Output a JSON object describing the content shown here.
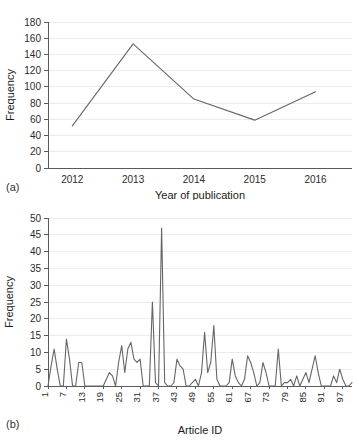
{
  "figure": {
    "panel_a_label": "(a)",
    "panel_b_label": "(b)"
  },
  "chart_data": [
    {
      "id": "panel-a",
      "type": "line",
      "title": "",
      "xlabel": "Year of publication",
      "ylabel": "Frequency",
      "categories": [
        "2012",
        "2013",
        "2014",
        "2015",
        "2016"
      ],
      "x": [
        2012,
        2013,
        2014,
        2015,
        2016
      ],
      "values": [
        52,
        153,
        85,
        59,
        94
      ],
      "xlim": [
        2011.6,
        2016.6
      ],
      "ylim": [
        0,
        180
      ],
      "yticks": [
        0,
        20,
        40,
        60,
        80,
        100,
        120,
        140,
        160,
        180
      ],
      "ytick_labels": [
        "0",
        "20",
        "40",
        "60",
        "80",
        "100",
        "120",
        "140",
        "160",
        "180"
      ],
      "xtick_labels": [
        "2012",
        "2013",
        "2014",
        "2015",
        "2016"
      ],
      "grid": "horizontal",
      "legend": "none",
      "line_color": "#666666"
    },
    {
      "id": "panel-b",
      "type": "line",
      "title": "",
      "xlabel": "Article ID",
      "ylabel": "Frequency",
      "xlim": [
        1,
        100
      ],
      "ylim": [
        0,
        50
      ],
      "yticks": [
        0,
        5,
        10,
        15,
        20,
        25,
        30,
        35,
        40,
        45,
        50
      ],
      "ytick_labels": [
        "0",
        "5",
        "10",
        "15",
        "20",
        "25",
        "30",
        "35",
        "40",
        "45",
        "50"
      ],
      "xticks": [
        1,
        7,
        13,
        19,
        25,
        31,
        37,
        43,
        49,
        55,
        61,
        67,
        73,
        79,
        85,
        91,
        97
      ],
      "xtick_labels": [
        "1",
        "7",
        "13",
        "19",
        "25",
        "31",
        "37",
        "43",
        "49",
        "55",
        "61",
        "67",
        "73",
        "79",
        "85",
        "91",
        "97"
      ],
      "grid": "horizontal",
      "legend": "none",
      "line_color": "#666666",
      "x": [
        1,
        2,
        3,
        4,
        5,
        6,
        7,
        8,
        9,
        10,
        11,
        12,
        13,
        14,
        15,
        16,
        17,
        18,
        19,
        20,
        21,
        22,
        23,
        24,
        25,
        26,
        27,
        28,
        29,
        30,
        31,
        32,
        33,
        34,
        35,
        36,
        37,
        38,
        39,
        40,
        41,
        42,
        43,
        44,
        45,
        46,
        47,
        48,
        49,
        50,
        51,
        52,
        53,
        54,
        55,
        56,
        57,
        58,
        59,
        60,
        61,
        62,
        63,
        64,
        65,
        66,
        67,
        68,
        69,
        70,
        71,
        72,
        73,
        74,
        75,
        76,
        77,
        78,
        79,
        80,
        81,
        82,
        83,
        84,
        85,
        86,
        87,
        88,
        89,
        90,
        91,
        92,
        93,
        94,
        95,
        96,
        97,
        98,
        99,
        100
      ],
      "values": [
        0,
        6,
        11,
        5,
        0,
        0,
        14,
        8,
        0,
        0,
        7,
        7,
        0,
        0,
        0,
        0,
        0,
        0,
        0,
        2,
        4,
        3,
        0,
        7,
        12,
        4,
        11,
        13,
        8,
        7,
        8,
        0,
        0,
        0,
        25,
        1,
        0,
        47,
        1,
        0,
        0,
        1,
        8,
        6,
        5,
        0,
        0,
        1,
        2,
        0,
        4,
        16,
        4,
        7,
        18,
        2,
        0,
        0,
        0,
        1,
        8,
        3,
        1,
        0,
        2,
        9,
        7,
        4,
        0,
        1,
        7,
        4,
        0,
        0,
        0,
        11,
        0,
        1,
        1,
        2,
        0,
        3,
        0,
        2,
        4,
        1,
        5,
        9,
        4,
        0,
        0,
        0,
        0,
        3,
        1,
        5,
        2,
        0,
        0,
        1
      ]
    }
  ]
}
